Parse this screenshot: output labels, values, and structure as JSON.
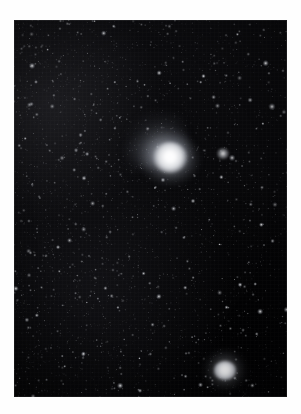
{
  "image": {
    "kind": "astronomical-photograph",
    "subject": "comet",
    "description": "Long-exposure night-sky photograph: a bright comet with a glowing coma and a diffuse fan-shaped tail sweeping up and to the left, set against a dense field of faint stars. A bright fuzzy star sits near the lower right and a fainter star lies to the right of the comet.",
    "orientation": "portrait",
    "border": {
      "style": "white-paper-margin",
      "color": "#ffffff",
      "left_px": 14,
      "top_px": 20,
      "right_px": 14,
      "bottom_px": 17
    },
    "sky": {
      "background_color": "#050507",
      "deepest_black": "#020203",
      "lifted_corner": "#1e1e22",
      "noise": "film-grain-and-jpeg-blocking"
    },
    "objects": [
      {
        "name": "comet-nucleus",
        "label": "Comet nucleus",
        "x": 167,
        "y": 152,
        "brightness": "saturated-white",
        "color": "#ffffff"
      },
      {
        "name": "comet-coma",
        "label": "Comet coma",
        "x": 170,
        "y": 152,
        "width": 76,
        "height": 66,
        "color": "#d2d5de"
      },
      {
        "name": "comet-tail",
        "label": "Comet tail",
        "x": 134,
        "y": 124,
        "direction": "up-left",
        "angle_deg": -14,
        "color": "#969ba5"
      },
      {
        "name": "bright-star-lower-right",
        "label": "Bright fuzzy star",
        "x": 225,
        "y": 370,
        "brightness": "bright",
        "color": "#ffffff"
      },
      {
        "name": "star-right-of-comet",
        "label": "Faint star right of comet",
        "x": 223,
        "y": 154,
        "brightness": "medium",
        "color": "#ffffff"
      }
    ],
    "star_field": {
      "density": "dense",
      "note": "hundreds of unresolved point sources, brighter and denser toward the left and lower-left of the frame"
    }
  }
}
